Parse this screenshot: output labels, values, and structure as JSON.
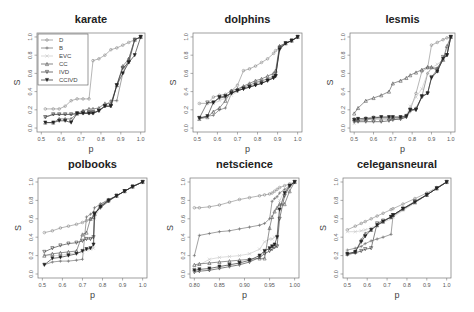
{
  "figure": {
    "panels_layout": "2 rows x 3 columns",
    "shared_ylabel": "S",
    "shared_xlabel": "p"
  },
  "legend": {
    "panel": "karate",
    "position": "top-left",
    "entries": [
      {
        "label": "D",
        "marker": "o",
        "color": "#8a8a8a"
      },
      {
        "label": "B",
        "marker": "+",
        "color": "#6a6a6a"
      },
      {
        "label": "EVC",
        "marker": "x",
        "color": "#c8c8c8"
      },
      {
        "label": "CC",
        "marker": "triangle",
        "color": "#555555"
      },
      {
        "label": "IVD",
        "marker": "triangle-down",
        "color": "#3a3a3a"
      },
      {
        "label": "CCIVD",
        "marker": "triangle-down-filled",
        "color": "#222222"
      }
    ]
  },
  "chart_data": [
    {
      "type": "line",
      "title": "karate",
      "xlabel": "p",
      "ylabel": "S",
      "xlim": [
        0.5,
        1.0
      ],
      "ylim": [
        0.0,
        1.0
      ],
      "xticks": [
        "0.5",
        "0.6",
        "0.7",
        "0.8",
        "0.9",
        "1.0"
      ],
      "yticks": [
        "0.0",
        "0.2",
        "0.4",
        "0.6",
        "0.8",
        "1.0"
      ],
      "grid": false,
      "legend_position": "top-left",
      "x": [
        0.52,
        0.56,
        0.59,
        0.62,
        0.65,
        0.68,
        0.71,
        0.74,
        0.76,
        0.79,
        0.82,
        0.85,
        0.88,
        0.91,
        0.94,
        0.97,
        1.0
      ],
      "series": [
        {
          "name": "D",
          "values": [
            0.21,
            0.21,
            0.21,
            0.24,
            0.3,
            0.32,
            0.32,
            0.32,
            0.74,
            0.76,
            0.8,
            0.86,
            0.88,
            0.91,
            0.94,
            0.97,
            1.0
          ]
        },
        {
          "name": "B",
          "values": [
            0.12,
            0.15,
            0.15,
            0.15,
            0.15,
            0.16,
            0.16,
            0.16,
            0.16,
            0.19,
            0.24,
            0.3,
            0.3,
            0.6,
            0.76,
            0.97,
            1.0
          ]
        },
        {
          "name": "EVC",
          "values": [
            0.12,
            0.15,
            0.15,
            0.15,
            0.15,
            0.15,
            0.16,
            0.16,
            0.16,
            0.19,
            0.24,
            0.24,
            0.47,
            0.66,
            0.72,
            0.97,
            1.0
          ]
        },
        {
          "name": "CC",
          "values": [
            0.06,
            0.06,
            0.1,
            0.1,
            0.1,
            0.16,
            0.19,
            0.21,
            0.21,
            0.22,
            0.27,
            0.27,
            0.47,
            0.68,
            0.76,
            0.97,
            1.0
          ]
        },
        {
          "name": "IVD",
          "values": [
            0.12,
            0.15,
            0.15,
            0.15,
            0.15,
            0.16,
            0.17,
            0.17,
            0.17,
            0.19,
            0.24,
            0.24,
            0.47,
            0.66,
            0.72,
            0.97,
            1.0
          ]
        },
        {
          "name": "CCIVD",
          "values": [
            0.06,
            0.06,
            0.08,
            0.08,
            0.06,
            0.16,
            0.16,
            0.16,
            0.16,
            0.19,
            0.24,
            0.24,
            0.47,
            0.6,
            0.72,
            0.8,
            1.0
          ]
        }
      ]
    },
    {
      "type": "line",
      "title": "dolphins",
      "xlabel": "p",
      "ylabel": "S",
      "xlim": [
        0.5,
        1.0
      ],
      "ylim": [
        0.0,
        1.0
      ],
      "xticks": [
        "0.5",
        "0.6",
        "0.7",
        "0.8",
        "0.9",
        "1.0"
      ],
      "yticks": [
        "0.0",
        "0.2",
        "0.4",
        "0.6",
        "0.8",
        "1.0"
      ],
      "grid": false,
      "x": [
        0.51,
        0.55,
        0.58,
        0.61,
        0.64,
        0.67,
        0.7,
        0.73,
        0.76,
        0.79,
        0.82,
        0.85,
        0.88,
        0.89,
        0.91,
        0.94,
        0.97,
        1.0
      ],
      "series": [
        {
          "name": "D",
          "values": [
            0.27,
            0.27,
            0.34,
            0.36,
            0.37,
            0.41,
            0.47,
            0.63,
            0.65,
            0.68,
            0.72,
            0.76,
            0.82,
            0.85,
            0.88,
            0.93,
            0.96,
            1.0
          ]
        },
        {
          "name": "B",
          "values": [
            0.11,
            0.13,
            0.14,
            0.2,
            0.22,
            0.38,
            0.42,
            0.45,
            0.47,
            0.5,
            0.52,
            0.54,
            0.56,
            0.58,
            0.9,
            0.93,
            0.96,
            1.0
          ]
        },
        {
          "name": "EVC",
          "values": [
            0.27,
            0.27,
            0.27,
            0.3,
            0.33,
            0.36,
            0.4,
            0.44,
            0.46,
            0.49,
            0.51,
            0.53,
            0.56,
            0.57,
            0.89,
            0.93,
            0.96,
            1.0
          ]
        },
        {
          "name": "CC",
          "values": [
            0.1,
            0.12,
            0.18,
            0.22,
            0.3,
            0.41,
            0.43,
            0.46,
            0.49,
            0.52,
            0.54,
            0.57,
            0.6,
            0.63,
            0.9,
            0.93,
            0.96,
            1.0
          ]
        },
        {
          "name": "IVD",
          "values": [
            0.11,
            0.28,
            0.28,
            0.33,
            0.34,
            0.39,
            0.41,
            0.43,
            0.45,
            0.47,
            0.49,
            0.52,
            0.55,
            0.57,
            0.88,
            0.93,
            0.96,
            1.0
          ]
        },
        {
          "name": "CCIVD",
          "values": [
            0.11,
            0.13,
            0.28,
            0.34,
            0.35,
            0.38,
            0.41,
            0.43,
            0.45,
            0.47,
            0.49,
            0.52,
            0.55,
            0.57,
            0.86,
            0.93,
            0.96,
            1.0
          ]
        }
      ]
    },
    {
      "type": "line",
      "title": "lesmis",
      "xlabel": "p",
      "ylabel": "S",
      "xlim": [
        0.5,
        1.0
      ],
      "ylim": [
        0.0,
        1.0
      ],
      "xticks": [
        "0.5",
        "0.6",
        "0.7",
        "0.8",
        "0.9",
        "1.0"
      ],
      "yticks": [
        "0.0",
        "0.2",
        "0.4",
        "0.6",
        "0.8",
        "1.0"
      ],
      "grid": false,
      "x": [
        0.5,
        0.52,
        0.56,
        0.6,
        0.64,
        0.68,
        0.7,
        0.74,
        0.77,
        0.79,
        0.82,
        0.85,
        0.88,
        0.9,
        0.93,
        0.96,
        0.98,
        1.0
      ],
      "series": [
        {
          "name": "D",
          "values": [
            0.1,
            0.1,
            0.11,
            0.12,
            0.12,
            0.12,
            0.12,
            0.12,
            0.14,
            0.2,
            0.38,
            0.62,
            0.66,
            0.91,
            0.94,
            0.97,
            0.99,
            1.0
          ]
        },
        {
          "name": "B",
          "values": [
            0.08,
            0.08,
            0.09,
            0.1,
            0.1,
            0.1,
            0.1,
            0.1,
            0.12,
            0.18,
            0.22,
            0.34,
            0.6,
            0.66,
            0.66,
            0.75,
            0.8,
            1.0
          ]
        },
        {
          "name": "EVC",
          "values": [
            0.05,
            0.08,
            0.1,
            0.1,
            0.1,
            0.1,
            0.1,
            0.1,
            0.14,
            0.24,
            0.34,
            0.43,
            0.6,
            0.66,
            0.7,
            0.75,
            0.88,
            1.0
          ]
        },
        {
          "name": "CC",
          "values": [
            0.16,
            0.22,
            0.3,
            0.33,
            0.36,
            0.4,
            0.49,
            0.52,
            0.55,
            0.58,
            0.61,
            0.64,
            0.67,
            0.67,
            0.63,
            0.75,
            0.9,
            1.0
          ]
        },
        {
          "name": "IVD",
          "values": [
            0.07,
            0.07,
            0.07,
            0.07,
            0.07,
            0.08,
            0.09,
            0.1,
            0.12,
            0.2,
            0.2,
            0.34,
            0.38,
            0.56,
            0.64,
            0.78,
            0.8,
            1.0
          ]
        },
        {
          "name": "CCIVD",
          "values": [
            0.09,
            0.1,
            0.1,
            0.11,
            0.12,
            0.12,
            0.12,
            0.12,
            0.13,
            0.2,
            0.2,
            0.35,
            0.38,
            0.55,
            0.62,
            0.76,
            0.8,
            1.0
          ]
        }
      ]
    },
    {
      "type": "line",
      "title": "polbooks",
      "xlabel": "p",
      "ylabel": "S",
      "xlim": [
        0.5,
        1.0
      ],
      "ylim": [
        0.0,
        1.0
      ],
      "xticks": [
        "0.5",
        "0.6",
        "0.7",
        "0.8",
        "0.9",
        "1.0"
      ],
      "yticks": [
        "0.0",
        "0.2",
        "0.4",
        "0.6",
        "0.8",
        "1.0"
      ],
      "grid": false,
      "x": [
        0.51,
        0.55,
        0.59,
        0.63,
        0.67,
        0.7,
        0.72,
        0.74,
        0.755,
        0.76,
        0.79,
        0.83,
        0.87,
        0.91,
        0.95,
        1.0
      ],
      "series": [
        {
          "name": "D",
          "values": [
            0.45,
            0.47,
            0.5,
            0.52,
            0.54,
            0.56,
            0.58,
            0.6,
            0.62,
            0.64,
            0.76,
            0.8,
            0.85,
            0.9,
            0.95,
            1.0
          ]
        },
        {
          "name": "B",
          "values": [
            0.1,
            0.13,
            0.14,
            0.14,
            0.15,
            0.16,
            0.62,
            0.65,
            0.67,
            0.72,
            0.76,
            0.81,
            0.85,
            0.9,
            0.95,
            1.0
          ]
        },
        {
          "name": "EVC",
          "values": [
            0.2,
            0.2,
            0.2,
            0.22,
            0.23,
            0.24,
            0.26,
            0.27,
            0.28,
            0.6,
            0.74,
            0.79,
            0.85,
            0.9,
            0.95,
            1.0
          ]
        },
        {
          "name": "CC",
          "values": [
            0.2,
            0.22,
            0.23,
            0.24,
            0.25,
            0.43,
            0.45,
            0.6,
            0.62,
            0.65,
            0.74,
            0.8,
            0.85,
            0.9,
            0.95,
            1.0
          ]
        },
        {
          "name": "IVD",
          "values": [
            0.24,
            0.28,
            0.31,
            0.33,
            0.34,
            0.36,
            0.38,
            0.38,
            0.4,
            0.66,
            0.72,
            0.79,
            0.85,
            0.9,
            0.95,
            1.0
          ]
        },
        {
          "name": "CCIVD",
          "values": [
            0.1,
            0.17,
            0.18,
            0.2,
            0.22,
            0.25,
            0.27,
            0.28,
            0.32,
            0.65,
            0.73,
            0.8,
            0.85,
            0.9,
            0.95,
            1.0
          ]
        }
      ]
    },
    {
      "type": "line",
      "title": "netscience",
      "xlabel": "p",
      "ylabel": "S",
      "xlim": [
        0.8,
        1.0
      ],
      "ylim": [
        0.0,
        1.0
      ],
      "xticks": [
        "0.80",
        "0.85",
        "0.90",
        "0.95",
        "1.00"
      ],
      "yticks": [
        "0.0",
        "0.2",
        "0.4",
        "0.6",
        "0.8",
        "1.0"
      ],
      "grid": false,
      "x": [
        0.8,
        0.81,
        0.83,
        0.85,
        0.87,
        0.89,
        0.91,
        0.93,
        0.94,
        0.95,
        0.955,
        0.96,
        0.965,
        0.97,
        0.98,
        0.99,
        1.0
      ],
      "series": [
        {
          "name": "D",
          "values": [
            0.72,
            0.72,
            0.73,
            0.75,
            0.78,
            0.81,
            0.83,
            0.85,
            0.86,
            0.87,
            0.88,
            0.9,
            0.92,
            0.94,
            0.96,
            0.98,
            1.0
          ]
        },
        {
          "name": "B",
          "values": [
            0.2,
            0.42,
            0.44,
            0.46,
            0.47,
            0.49,
            0.51,
            0.53,
            0.55,
            0.6,
            0.79,
            0.82,
            0.84,
            0.88,
            0.92,
            0.96,
            1.0
          ]
        },
        {
          "name": "EVC",
          "values": [
            0.08,
            0.1,
            0.16,
            0.18,
            0.19,
            0.2,
            0.22,
            0.27,
            0.35,
            0.38,
            0.38,
            0.4,
            0.42,
            0.8,
            0.9,
            0.97,
            1.0
          ]
        },
        {
          "name": "CC",
          "values": [
            0.1,
            0.11,
            0.12,
            0.13,
            0.14,
            0.15,
            0.16,
            0.17,
            0.17,
            0.5,
            0.62,
            0.68,
            0.72,
            0.76,
            0.76,
            0.9,
            1.0
          ]
        },
        {
          "name": "IVD",
          "values": [
            0.02,
            0.03,
            0.04,
            0.06,
            0.08,
            0.1,
            0.13,
            0.18,
            0.22,
            0.25,
            0.27,
            0.29,
            0.3,
            0.6,
            0.85,
            0.95,
            1.0
          ]
        },
        {
          "name": "CCIVD",
          "values": [
            0.04,
            0.05,
            0.06,
            0.08,
            0.1,
            0.12,
            0.15,
            0.2,
            0.25,
            0.28,
            0.3,
            0.32,
            0.4,
            0.7,
            0.88,
            0.96,
            1.0
          ]
        }
      ]
    },
    {
      "type": "line",
      "title": "celegansneural",
      "xlabel": "p",
      "ylabel": "S",
      "xlim": [
        0.5,
        1.0
      ],
      "ylim": [
        0.0,
        1.0
      ],
      "xticks": [
        "0.5",
        "0.6",
        "0.7",
        "0.8",
        "0.9",
        "1.0"
      ],
      "yticks": [
        "0.0",
        "0.2",
        "0.4",
        "0.6",
        "0.8",
        "1.0"
      ],
      "grid": false,
      "x": [
        0.5,
        0.54,
        0.57,
        0.59,
        0.62,
        0.65,
        0.68,
        0.72,
        0.73,
        0.78,
        0.84,
        0.9,
        0.95,
        1.0
      ],
      "series": [
        {
          "name": "D",
          "values": [
            0.48,
            0.52,
            0.55,
            0.57,
            0.6,
            0.63,
            0.66,
            0.7,
            0.71,
            0.76,
            0.82,
            0.88,
            0.94,
            1.0
          ]
        },
        {
          "name": "B",
          "values": [
            0.26,
            0.28,
            0.3,
            0.33,
            0.36,
            0.38,
            0.4,
            0.43,
            0.63,
            0.7,
            0.78,
            0.86,
            0.93,
            1.0
          ]
        },
        {
          "name": "EVC",
          "values": [
            0.46,
            0.46,
            0.47,
            0.48,
            0.5,
            0.53,
            0.56,
            0.6,
            0.62,
            0.69,
            0.77,
            0.86,
            0.93,
            1.0
          ]
        },
        {
          "name": "CC",
          "values": [
            0.22,
            0.24,
            0.37,
            0.44,
            0.48,
            0.53,
            0.57,
            0.62,
            0.64,
            0.71,
            0.78,
            0.86,
            0.93,
            1.0
          ]
        },
        {
          "name": "IVD",
          "values": [
            0.21,
            0.23,
            0.25,
            0.27,
            0.28,
            0.55,
            0.58,
            0.62,
            0.64,
            0.71,
            0.79,
            0.86,
            0.93,
            1.0
          ]
        },
        {
          "name": "CCIVD",
          "values": [
            0.22,
            0.24,
            0.35,
            0.41,
            0.48,
            0.53,
            0.57,
            0.62,
            0.64,
            0.71,
            0.78,
            0.86,
            0.93,
            1.0
          ]
        }
      ]
    }
  ],
  "panels": [
    {
      "title": "karate",
      "ylabel": "S",
      "xlabel": "p"
    },
    {
      "title": "dolphins",
      "ylabel": "S",
      "xlabel": "p"
    },
    {
      "title": "lesmis",
      "ylabel": "S",
      "xlabel": "p"
    },
    {
      "title": "polbooks",
      "ylabel": "S",
      "xlabel": "p"
    },
    {
      "title": "netscience",
      "ylabel": "S",
      "xlabel": "p"
    },
    {
      "title": "celegansneural",
      "ylabel": "S",
      "xlabel": "p"
    }
  ]
}
